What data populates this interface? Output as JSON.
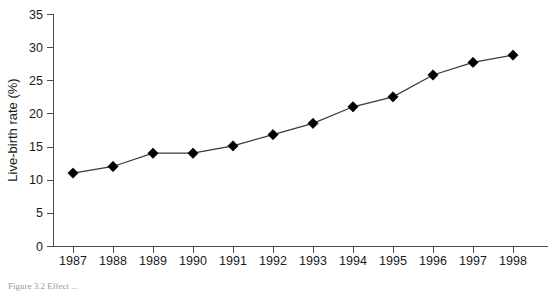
{
  "figure": {
    "caption": "Figure 3.2   Effect ...",
    "caption_visible": false
  },
  "chart_data": {
    "type": "line",
    "title": "",
    "xlabel": "Year",
    "ylabel": "Live-birth rate (%)",
    "categories": [
      "1987",
      "1988",
      "1989",
      "1990",
      "1991",
      "1992",
      "1993",
      "1994",
      "1995",
      "1996",
      "1997",
      "1998"
    ],
    "values": [
      11.0,
      12.0,
      14.0,
      14.0,
      15.1,
      16.8,
      18.5,
      21.0,
      22.5,
      25.8,
      27.7,
      28.8
    ],
    "series": [
      {
        "name": "Live-birth rate",
        "values": [
          11.0,
          12.0,
          14.0,
          14.0,
          15.1,
          16.8,
          18.5,
          21.0,
          22.5,
          25.8,
          27.7,
          28.8
        ],
        "marker": "diamond",
        "color": "#000000"
      }
    ],
    "ylim": [
      0,
      35
    ],
    "yticks": [
      0,
      5,
      10,
      15,
      20,
      25,
      30,
      35
    ],
    "ytick_labels": [
      "0",
      "5",
      "10",
      "15",
      "20",
      "25",
      "30",
      "35"
    ],
    "xtick_labels": [
      "1987",
      "1988",
      "1989",
      "1990",
      "1991",
      "1992",
      "1993",
      "1994",
      "1995",
      "1996",
      "1997",
      "1998"
    ],
    "grid": false,
    "legend": false,
    "legend_position": "none",
    "marker_color": "#000000",
    "line_color": "#3a3a3a",
    "axis_color": "#4d4d4d"
  }
}
